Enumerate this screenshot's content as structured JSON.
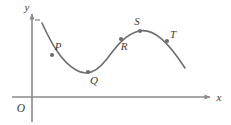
{
  "figure": {
    "background_color": "#ffffff",
    "axis_color": "#8a8a8a",
    "curve_color": "#6e6e6e",
    "label_color": "#3a3a3a",
    "point_color": "#6e6e6e",
    "curve_stroke_width": 1.6,
    "axis_stroke_width": 1.6
  },
  "axes": {
    "x_axis": {
      "label": "x",
      "label_x": 219,
      "label_y": 101,
      "line": {
        "x1": 12,
        "y1": 97,
        "x2": 210,
        "y2": 97
      },
      "arrow": "arrow-right"
    },
    "y_axis": {
      "label": "y",
      "label_x": 27,
      "label_y": 11,
      "line": {
        "x1": 32,
        "y1": 122,
        "x2": 32,
        "y2": 14
      },
      "arrow": "arrow-up",
      "tick": {
        "x1": 35,
        "y1": 20,
        "x2": 40,
        "y2": 20
      }
    },
    "origin": {
      "label": "O",
      "label_x": 21,
      "label_y": 112
    }
  },
  "chart_data": {
    "type": "line",
    "title": "",
    "xlabel": "x",
    "ylabel": "y",
    "grid": false,
    "legend": "none",
    "curve_path": "M 42,23 C 52,45 62,62 76,70 C 86,76 96,73 106,60 C 116,47 124,35 139,31 C 154,28 168,42 185,68",
    "points": [
      {
        "name": "P",
        "x": 52,
        "y": 55,
        "label_x": 58,
        "label_y": 50,
        "description": "on the descending portion of the curve"
      },
      {
        "name": "Q",
        "x": 88,
        "y": 72,
        "label_x": 94,
        "label_y": 84,
        "description": "at the local minimum of the curve"
      },
      {
        "name": "R",
        "x": 121,
        "y": 39,
        "label_x": 124,
        "label_y": 50,
        "description": "on the ascending portion of the curve"
      },
      {
        "name": "S",
        "x": 140,
        "y": 31,
        "label_x": 137,
        "label_y": 25,
        "description": "at the local maximum of the curve"
      },
      {
        "name": "T",
        "x": 167,
        "y": 41,
        "label_x": 173,
        "label_y": 38,
        "description": "on the final descending portion of the curve"
      }
    ],
    "point_radius": 2.1
  }
}
